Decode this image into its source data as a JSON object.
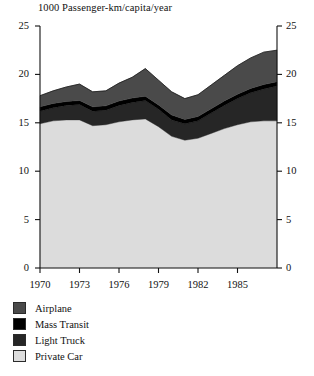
{
  "chart_data": {
    "type": "area",
    "stacked": true,
    "title": "1000 Passenger-km/capita/year",
    "xlabel": "",
    "ylabel": "",
    "xlim": [
      1970,
      1988
    ],
    "ylim": [
      0,
      25
    ],
    "grid": false,
    "legend_position": "below-left",
    "x": [
      1970,
      1971,
      1972,
      1973,
      1974,
      1975,
      1976,
      1977,
      1978,
      1979,
      1980,
      1981,
      1982,
      1983,
      1984,
      1985,
      1986,
      1987,
      1988
    ],
    "x_tick_labels": [
      "1970",
      "1973",
      "1976",
      "1979",
      "1982",
      "1985"
    ],
    "x_tick_values": [
      1970,
      1973,
      1976,
      1979,
      1982,
      1985
    ],
    "y_tick_labels": [
      "0",
      "5",
      "10",
      "15",
      "20",
      "25"
    ],
    "y_tick_values": [
      0,
      5,
      10,
      15,
      20,
      25
    ],
    "series": [
      {
        "name": "Private Car",
        "color": "#dcdcdc",
        "values": [
          14.9,
          15.2,
          15.3,
          15.3,
          14.7,
          14.8,
          15.1,
          15.3,
          15.4,
          14.6,
          13.6,
          13.2,
          13.4,
          13.9,
          14.4,
          14.8,
          15.1,
          15.2,
          15.2
        ]
      },
      {
        "name": "Light Truck",
        "color": "#262626",
        "values": [
          1.3,
          1.35,
          1.5,
          1.6,
          1.5,
          1.5,
          1.7,
          1.8,
          1.9,
          1.8,
          1.7,
          1.7,
          1.8,
          2.1,
          2.4,
          2.7,
          3.0,
          3.3,
          3.6
        ]
      },
      {
        "name": "Mass Transit",
        "color": "#000000",
        "values": [
          0.45,
          0.45,
          0.4,
          0.4,
          0.45,
          0.45,
          0.45,
          0.45,
          0.45,
          0.45,
          0.5,
          0.45,
          0.45,
          0.45,
          0.45,
          0.45,
          0.45,
          0.45,
          0.45
        ]
      },
      {
        "name": "Airplane",
        "color": "#4a4a4a",
        "values": [
          1.15,
          1.3,
          1.5,
          1.7,
          1.55,
          1.55,
          1.85,
          2.15,
          2.85,
          2.55,
          2.4,
          2.15,
          2.25,
          2.45,
          2.65,
          2.95,
          3.15,
          3.35,
          3.25
        ]
      }
    ],
    "totals": [
      17.8,
      18.3,
      18.7,
      19.0,
      18.2,
      18.3,
      19.1,
      19.7,
      20.6,
      19.4,
      18.2,
      17.5,
      17.9,
      18.9,
      19.9,
      20.9,
      21.7,
      22.3,
      22.5
    ]
  },
  "legend": {
    "items": [
      {
        "label": "Airplane",
        "color": "#4a4a4a"
      },
      {
        "label": "Mass Transit",
        "color": "#000000"
      },
      {
        "label": "Light Truck",
        "color": "#262626"
      },
      {
        "label": "Private Car",
        "color": "#dcdcdc"
      }
    ]
  },
  "axes": {
    "left_ticks": [
      "25",
      "20",
      "15",
      "10",
      "5",
      "0"
    ],
    "right_ticks": [
      "25",
      "20",
      "15",
      "10",
      "5",
      "0"
    ],
    "bottom_ticks": [
      "1970",
      "1973",
      "1976",
      "1979",
      "1982",
      "1985"
    ]
  }
}
